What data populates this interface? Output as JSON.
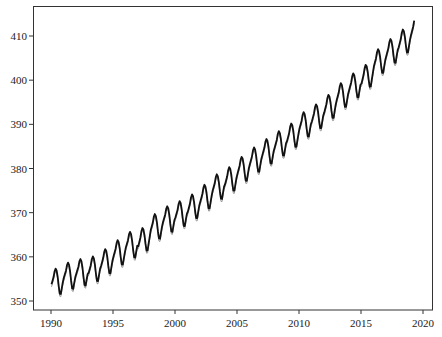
{
  "chart_data": {
    "type": "line",
    "title": "",
    "xlabel": "",
    "ylabel": "",
    "xlim": [
      1988.5,
      2020.7
    ],
    "ylim": [
      348.0,
      416.8
    ],
    "grid": false,
    "legend": null,
    "x_ticks": [
      1990,
      1995,
      2000,
      2005,
      2010,
      2015,
      2020
    ],
    "y_ticks": [
      350,
      360,
      370,
      380,
      390,
      400,
      410
    ],
    "annual_means": {
      "years": [
        1990,
        1991,
        1992,
        1993,
        1994,
        1995,
        1996,
        1997,
        1998,
        1999,
        2000,
        2001,
        2002,
        2003,
        2004,
        2005,
        2006,
        2007,
        2008,
        2009,
        2010,
        2011,
        2012,
        2013,
        2014,
        2015,
        2016,
        2017,
        2018,
        2019
      ],
      "values": [
        354.4,
        355.7,
        356.5,
        357.2,
        358.9,
        360.9,
        362.7,
        363.8,
        366.8,
        368.5,
        369.7,
        371.3,
        373.5,
        375.8,
        377.5,
        379.8,
        381.9,
        383.8,
        385.6,
        387.4,
        389.9,
        391.7,
        393.9,
        396.5,
        398.7,
        400.8,
        404.2,
        406.5,
        408.7,
        411.4
      ]
    },
    "seasonal_cycle_offsets": [
      0.0,
      0.7,
      1.4,
      2.6,
      3.1,
      2.5,
      1.0,
      -1.2,
      -3.0,
      -3.2,
      -1.9,
      -0.7
    ],
    "series": [
      {
        "name": "observed",
        "color": "#111111",
        "width": 1.8,
        "x_start": 1990.0,
        "x_end": 2019.33,
        "step": 0.0833,
        "offset": 0.0
      },
      {
        "name": "fitted",
        "color": "#9a9a9a",
        "width": 1.0,
        "x_start": 1990.0,
        "x_end": 2019.33,
        "step": 0.0833,
        "offset": -0.6
      }
    ]
  },
  "axes": {
    "frame": {
      "left": 33,
      "top": 6,
      "right": 433,
      "bottom": 310
    },
    "x_tick_px": {
      "1990": 51,
      "2020": 423
    },
    "y_tick_px": {
      "350": 301,
      "410": 36
    }
  }
}
